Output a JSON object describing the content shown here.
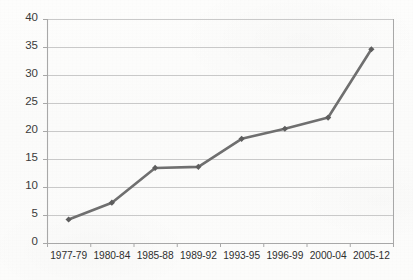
{
  "chart_data": {
    "type": "line",
    "title": "",
    "subtitle": "",
    "xlabel": "",
    "ylabel": "",
    "categories": [
      "1977-79",
      "1980-84",
      "1985-88",
      "1989-92",
      "1993-95",
      "1996-99",
      "2000-04",
      "2005-12"
    ],
    "values": [
      4.2,
      7.2,
      13.4,
      13.6,
      18.6,
      20.4,
      22.4,
      34.6
    ],
    "series": [
      {
        "name": "series-1",
        "values": [
          4.2,
          7.2,
          13.4,
          13.6,
          18.6,
          20.4,
          22.4,
          34.6
        ]
      }
    ],
    "ylim": [
      0,
      40
    ],
    "xlim_categorical": true,
    "yticks": [
      0,
      5,
      10,
      15,
      20,
      25,
      30,
      35,
      40
    ],
    "ytick_labels": [
      "0",
      "5",
      "10",
      "15",
      "20",
      "25",
      "30",
      "35",
      "40"
    ],
    "grid": true,
    "grid_axis": "y",
    "legend": false,
    "legend_position": "none",
    "marker": "diamond",
    "annotations": []
  },
  "style": {
    "line_color": "#6f6f6f",
    "marker_color": "#5d5d5d",
    "grid_color": "#c9c9c9",
    "axis_color": "#a8a8a8",
    "tick_text_color": "#333333",
    "background_color": "#fcfcfb"
  },
  "layout": {
    "plot_left": 47,
    "plot_right": 393,
    "plot_top": 19,
    "plot_bottom": 243,
    "xlabel_y": 250
  }
}
